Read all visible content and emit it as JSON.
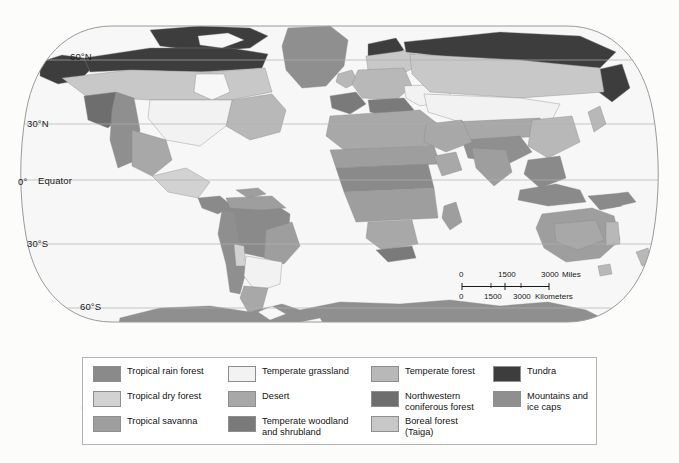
{
  "figure": {
    "type": "thematic-map",
    "projection": "Robinson"
  },
  "graticule": {
    "latitude_labels": [
      {
        "id": "lat-60n",
        "text": "60°N"
      },
      {
        "id": "lat-30n",
        "text": "30°N"
      },
      {
        "id": "lat-0",
        "text": "0°"
      },
      {
        "id": "lat-equator",
        "text": "Equator"
      },
      {
        "id": "lat-30s",
        "text": "30°S"
      },
      {
        "id": "lat-60s",
        "text": "60°S"
      }
    ]
  },
  "scale_bar": {
    "miles": {
      "unit_label": "Miles",
      "ticks": [
        "0",
        "1500",
        "3000"
      ]
    },
    "kilometers": {
      "unit_label": "Kilometers",
      "ticks": [
        "0",
        "1500",
        "3000"
      ]
    }
  },
  "legend": {
    "items": [
      {
        "label": "Tropical rain forest",
        "color": "#8a8a8a"
      },
      {
        "label": "Temperate grassland",
        "color": "#f2f2f2"
      },
      {
        "label": "Temperate forest",
        "color": "#b8b8b8"
      },
      {
        "label": "Tundra",
        "color": "#3d3d3d"
      },
      {
        "label": "Tropical dry forest",
        "color": "#d2d2d2"
      },
      {
        "label": "Desert",
        "color": "#a8a8a8"
      },
      {
        "label": "Northwestern\nconiferous forest",
        "color": "#6e6e6e"
      },
      {
        "label": "Mountains and\nice caps",
        "color": "#8f8f8f"
      },
      {
        "label": "Tropical savanna",
        "color": "#9e9e9e"
      },
      {
        "label": "Temperate woodland\nand shrubland",
        "color": "#7a7a7a"
      },
      {
        "label": "Boreal forest\n(Taiga)",
        "color": "#c8c8c8"
      }
    ]
  },
  "colors": {
    "ocean": "#f7f7f7",
    "map_outline": "#9a9a9a",
    "graticule": "#b0b0b0",
    "border": "#8a8a8a",
    "page_background": "#fcfcfb",
    "legend_border": "#b4b4b4"
  }
}
